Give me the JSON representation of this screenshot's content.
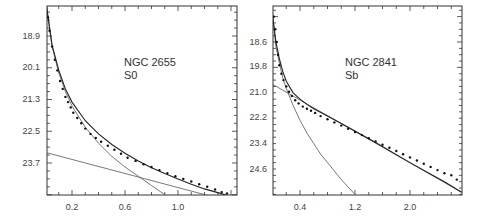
{
  "chart_data": [
    {
      "type": "scatter",
      "title": "",
      "annotation": [
        "NGC 2655",
        "S0"
      ],
      "xlabel": "",
      "ylabel": "",
      "xlim": [
        0.0,
        1.42
      ],
      "ylim": [
        17.7,
        25.0
      ],
      "y_inverted": true,
      "xticks": [
        0.2,
        0.6,
        1.0
      ],
      "yticks": [
        18.9,
        20.1,
        21.3,
        22.5,
        23.7
      ],
      "grid": false,
      "series": [
        {
          "name": "observed",
          "kind": "points",
          "x": [
            0.01,
            0.02,
            0.03,
            0.05,
            0.07,
            0.09,
            0.11,
            0.13,
            0.15,
            0.17,
            0.19,
            0.21,
            0.24,
            0.27,
            0.3,
            0.34,
            0.38,
            0.42,
            0.47,
            0.52,
            0.57,
            0.62,
            0.68,
            0.74,
            0.8,
            0.86,
            0.92,
            0.98,
            1.04,
            1.1,
            1.16,
            1.22,
            1.28,
            1.33,
            1.37,
            1.4
          ],
          "y": [
            17.7,
            18.2,
            18.7,
            19.3,
            19.8,
            20.2,
            20.6,
            20.9,
            21.2,
            21.4,
            21.6,
            21.8,
            22.0,
            22.2,
            22.4,
            22.6,
            22.75,
            22.9,
            23.05,
            23.2,
            23.35,
            23.5,
            23.62,
            23.75,
            23.85,
            23.97,
            24.08,
            24.2,
            24.3,
            24.4,
            24.5,
            24.6,
            24.7,
            24.8,
            24.85,
            24.95
          ]
        },
        {
          "name": "bulge fit",
          "kind": "line",
          "x": [
            0.0,
            0.05,
            0.1,
            0.15,
            0.2,
            0.3,
            0.4,
            0.5,
            0.6,
            0.7,
            0.8,
            0.9,
            0.93
          ],
          "y": [
            17.5,
            19.3,
            20.3,
            21.0,
            21.55,
            22.35,
            22.95,
            23.45,
            23.85,
            24.2,
            24.55,
            24.9,
            25.0
          ]
        },
        {
          "name": "disk fit",
          "kind": "line",
          "x": [
            0.0,
            1.28
          ],
          "y": [
            23.3,
            25.0
          ]
        },
        {
          "name": "sum fit",
          "kind": "line",
          "x": [
            0.0,
            0.05,
            0.1,
            0.15,
            0.2,
            0.3,
            0.4,
            0.5,
            0.6,
            0.7,
            0.8,
            0.9,
            1.0,
            1.1,
            1.2,
            1.3,
            1.42
          ],
          "y": [
            17.5,
            19.25,
            20.2,
            20.9,
            21.4,
            22.1,
            22.6,
            23.0,
            23.33,
            23.62,
            23.88,
            24.1,
            24.3,
            24.5,
            24.68,
            24.82,
            25.0
          ]
        }
      ]
    },
    {
      "type": "scatter",
      "title": "",
      "annotation": [
        "NGC 2841",
        "Sb"
      ],
      "xlabel": "",
      "ylabel": "",
      "xlim": [
        0.0,
        2.75
      ],
      "ylim": [
        17.3,
        25.8
      ],
      "y_inverted": true,
      "xticks": [
        0.4,
        1.2,
        2.0
      ],
      "yticks": [
        18.6,
        19.8,
        21.0,
        22.2,
        23.4,
        24.6
      ],
      "grid": false,
      "series": [
        {
          "name": "observed",
          "kind": "points",
          "x": [
            0.02,
            0.04,
            0.06,
            0.08,
            0.1,
            0.13,
            0.16,
            0.2,
            0.24,
            0.28,
            0.33,
            0.38,
            0.44,
            0.5,
            0.56,
            0.62,
            0.7,
            0.8,
            0.9,
            1.0,
            1.1,
            1.2,
            1.3,
            1.4,
            1.5,
            1.6,
            1.7,
            1.8,
            1.9,
            2.0,
            2.1,
            2.2,
            2.3,
            2.4,
            2.5,
            2.6,
            2.68
          ],
          "y": [
            17.4,
            18.0,
            18.6,
            19.2,
            19.7,
            20.1,
            20.4,
            20.7,
            20.95,
            21.15,
            21.35,
            21.5,
            21.65,
            21.75,
            21.85,
            21.95,
            22.1,
            22.25,
            22.4,
            22.55,
            22.7,
            22.85,
            23.0,
            23.15,
            23.3,
            23.45,
            23.6,
            23.75,
            23.9,
            24.05,
            24.2,
            24.35,
            24.5,
            24.65,
            24.8,
            24.9,
            25.1
          ]
        },
        {
          "name": "bulge fit",
          "kind": "line",
          "x": [
            0.0,
            0.05,
            0.1,
            0.15,
            0.2,
            0.3,
            0.4,
            0.5,
            0.6,
            0.7,
            0.8,
            0.9,
            1.0,
            1.1,
            1.2
          ],
          "y": [
            17.3,
            18.8,
            19.6,
            20.3,
            20.8,
            21.6,
            22.3,
            22.9,
            23.4,
            23.9,
            24.3,
            24.7,
            25.1,
            25.45,
            25.8
          ]
        },
        {
          "name": "disk fit",
          "kind": "line",
          "x": [
            0.0,
            2.75
          ],
          "y": [
            20.6,
            25.7
          ]
        },
        {
          "name": "sum fit",
          "kind": "line",
          "x": [
            0.0,
            0.05,
            0.1,
            0.15,
            0.2,
            0.3,
            0.4,
            0.5,
            0.6,
            0.8,
            1.0,
            1.5,
            2.0,
            2.5,
            2.75
          ],
          "y": [
            17.3,
            18.6,
            19.4,
            20.0,
            20.45,
            21.0,
            21.3,
            21.55,
            21.75,
            22.1,
            22.45,
            23.35,
            24.3,
            25.2,
            25.7
          ]
        }
      ]
    }
  ],
  "panels": [
    {
      "label_line1": "NGC 2655",
      "label_line2": "S0",
      "xticks": [
        "0.2",
        "0.6",
        "1.0"
      ],
      "yticks": [
        "18.9",
        "20.1",
        "21.3",
        "22.5",
        "23.7"
      ]
    },
    {
      "label_line1": "NGC 2841",
      "label_line2": "Sb",
      "xticks": [
        "0.4",
        "1.2",
        "2.0"
      ],
      "yticks": [
        "18.6",
        "19.8",
        "21.0",
        "22.2",
        "23.4",
        "24.6"
      ]
    }
  ],
  "colors": {
    "frame": "#333333",
    "fit_line": "#555555",
    "points": "#111111",
    "text": "#444444"
  }
}
